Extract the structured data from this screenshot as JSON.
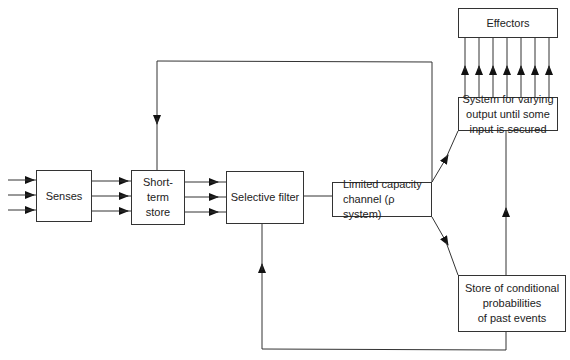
{
  "diagram": {
    "boxes": {
      "senses": "Senses",
      "short_term_store": "Short-\nterm\nstore",
      "selective_filter": "Selective filter",
      "limited_capacity": "Limited capacity\nchannel (ρ system)",
      "effectors": "Effectors",
      "system_varying": "System for varying\noutput until some\ninput is secured",
      "store_conditional": "Store of conditional\nprobabilities\nof past events"
    },
    "colors": {
      "line": "#333333",
      "background": "#ffffff"
    }
  }
}
